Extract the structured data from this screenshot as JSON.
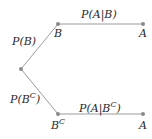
{
  "diagram": {
    "type": "probability-tree",
    "colors": {
      "edge": "#9c9c9c",
      "node": "#8a8a8a",
      "text": "#2a2a2a",
      "background": "#ffffff"
    },
    "nodes": {
      "root": {
        "label": ""
      },
      "b": {
        "label": "B"
      },
      "bc": {
        "label": "B",
        "sup": "C"
      },
      "a_top": {
        "label": "A"
      },
      "a_bottom": {
        "label": "A"
      }
    },
    "edges": {
      "root_b": {
        "label": "P(B)"
      },
      "root_bc": {
        "label_main": "P(B",
        "label_sup": "C",
        "label_end": ")"
      },
      "b_a": {
        "label": "P(A|B)"
      },
      "bc_a": {
        "label_main": "P(A|B",
        "label_sup": "C",
        "label_end": ")"
      }
    }
  }
}
